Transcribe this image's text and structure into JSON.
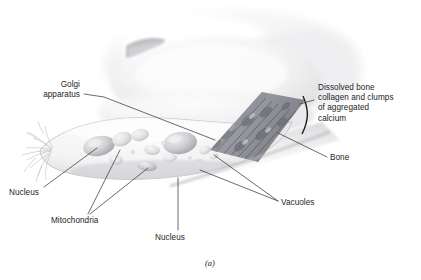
{
  "figure": {
    "caption": "(a)",
    "background_color": "#ffffff",
    "ink_color": "#1d1d1d",
    "leader_color": "#3a3a3a"
  },
  "labels": [
    {
      "id": "golgi",
      "text": "Golgi\napparatus",
      "align": "right",
      "x": 10,
      "y": 80,
      "w": 70,
      "leader": "M 84,94 L 104,97 L 215,140"
    },
    {
      "id": "nucleus-left",
      "text": "Nucleus",
      "align": "left",
      "x": 9,
      "y": 188,
      "w": 60,
      "leader": "M 44,187 L 97,148"
    },
    {
      "id": "mitochondria",
      "text": "Mitochondria",
      "align": "left",
      "x": 51,
      "y": 216,
      "w": 70,
      "leader": "M 88,214 L 120,150 M 90,214 L 148,168"
    },
    {
      "id": "nucleus-bottom",
      "text": "Nucleus",
      "align": "left",
      "x": 155,
      "y": 233,
      "w": 60,
      "leader": "M 178,230 L 178,178"
    },
    {
      "id": "dissolved-bone",
      "text": "Dissolved bone\ncollagen and clumps\nof aggregated\ncalcium",
      "align": "left",
      "x": 318,
      "y": 83,
      "w": 100,
      "leader": "M 314,100 L 300,104"
    },
    {
      "id": "bone",
      "text": "Bone",
      "align": "left",
      "x": 330,
      "y": 153,
      "w": 50,
      "leader": "M 327,157 L 278,133"
    },
    {
      "id": "vacuoles",
      "text": "Vacuoles",
      "align": "left",
      "x": 281,
      "y": 198,
      "w": 60,
      "leader": "M 278,201 L 200,170 M 278,201 L 214,155"
    }
  ]
}
